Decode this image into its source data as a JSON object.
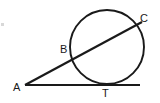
{
  "figure": {
    "background_color": "#ffffff",
    "stroke_color": "#1a1a1a",
    "label_color": "#1a1a1a",
    "labels": {
      "a": "A",
      "b": "B",
      "c": "C",
      "t": "T"
    },
    "points": {
      "A": {
        "x": 25,
        "y": 85
      },
      "B": {
        "x": 74,
        "y": 56
      },
      "C": {
        "x": 137,
        "y": 22
      },
      "T": {
        "x": 107,
        "y": 84
      }
    },
    "circle": {
      "cx": 107,
      "cy": 47,
      "r": 37
    },
    "tangent_line": {
      "x1": 25,
      "y1": 85,
      "x2": 140,
      "y2": 85
    },
    "secant_line": {
      "x1": 25,
      "y1": 85,
      "x2": 142,
      "y2": 22
    },
    "speck": {
      "x": 1,
      "y": 23,
      "color": "#d8d8d8"
    }
  }
}
